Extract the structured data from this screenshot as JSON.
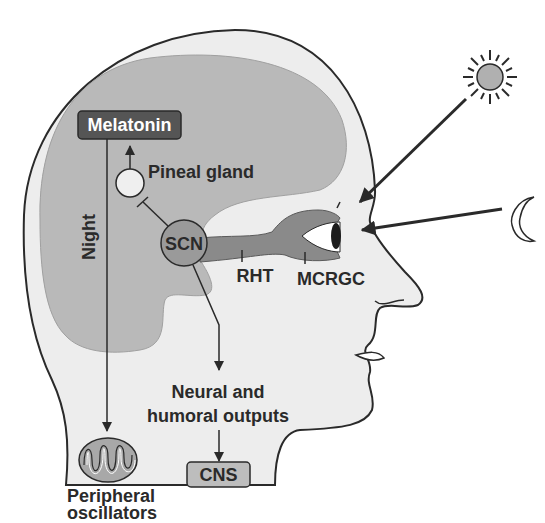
{
  "diagram": {
    "labels": {
      "melatonin": "Melatonin",
      "pineal_gland": "Pineal gland",
      "night": "Night",
      "scn": "SCN",
      "rht": "RHT",
      "mcrgc": "MCRGC",
      "neural_outputs_line1": "Neural and",
      "neural_outputs_line2": "humoral outputs",
      "cns": "CNS",
      "peripheral_line1": "Peripheral",
      "peripheral_line2": "oscillators"
    },
    "icons": {
      "sun": "sun-icon",
      "moon": "crescent-moon-icon",
      "eye": "eye-icon",
      "mitochondrion": "mitochondrion-icon"
    },
    "colors": {
      "head_fill": "#ededed",
      "brain_fill": "#b9b9b9",
      "scn_fill": "#9a9a9a",
      "tract_fill": "#8a8a8a",
      "melatonin_box": "#555555",
      "cns_box": "#bdbdbd",
      "outline": "#2a2a2a",
      "text": "#2a2a2a"
    }
  }
}
